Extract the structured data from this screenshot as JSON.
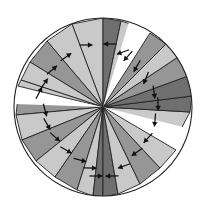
{
  "figure": {
    "kind": "geometric-diagram",
    "background_color": "#ffffff",
    "outline_color": "#232323",
    "arrow_color": "#111111",
    "canvas": {
      "width": 212,
      "height": 216
    }
  },
  "chart_data": {
    "type": "diagram",
    "xlabel": "",
    "ylabel": "",
    "grid": false,
    "legend": "none",
    "circle": {
      "cx": 103,
      "cy": 107,
      "r": 89,
      "stroke": "#232323"
    },
    "palette": {
      "light": "#c9c9c9",
      "medium": "#969696",
      "dark": "#6f6f6f",
      "gap": "#ffffff"
    },
    "gaps": [
      {
        "name": "gap-upper-right",
        "start_deg": 62,
        "end_deg": 73,
        "note": "white wedge from center toward upper right"
      },
      {
        "name": "gap-left",
        "start_deg": 168,
        "end_deg": 178,
        "note": "white wedge from center toward left"
      },
      {
        "name": "gap-lower-right",
        "start_deg": 336,
        "end_deg": 346,
        "note": "white wedge from center toward lower right"
      }
    ],
    "sectors": [
      {
        "id": 1,
        "start_deg": 73,
        "end_deg": 113,
        "triangles": 4,
        "label": "top sector"
      },
      {
        "id": 2,
        "start_deg": 113,
        "end_deg": 168,
        "triangles": 5,
        "label": "upper-left sector"
      },
      {
        "id": 3,
        "start_deg": 178,
        "end_deg": 248,
        "triangles": 6,
        "label": "lower-left sector"
      },
      {
        "id": 4,
        "start_deg": 248,
        "end_deg": 336,
        "triangles": 7,
        "label": "bottom sector"
      },
      {
        "id": 5,
        "start_deg": 346,
        "end_deg": 62,
        "triangles": 7,
        "label": "right sector"
      }
    ],
    "triangles": [
      {
        "a": [
          103,
          107
        ],
        "b": [
          103,
          18
        ],
        "c": [
          72,
          24
        ],
        "shade": "light",
        "arrow": {
          "x": 86,
          "y": 45,
          "angle_deg": 0
        }
      },
      {
        "a": [
          103,
          107
        ],
        "b": [
          103,
          18
        ],
        "c": [
          121,
          21
        ],
        "shade": "dark",
        "arrow": {
          "x": 110,
          "y": 44,
          "angle_deg": 180
        }
      },
      {
        "a": [
          103,
          107
        ],
        "b": [
          72,
          24
        ],
        "c": [
          47,
          41
        ],
        "shade": "light",
        "arrow": {
          "x": 66,
          "y": 57,
          "angle_deg": 35
        }
      },
      {
        "a": [
          103,
          107
        ],
        "b": [
          121,
          21
        ],
        "c": [
          140,
          27
        ],
        "shade": "light",
        "arrow": {
          "x": 123,
          "y": 52,
          "angle_deg": 200
        }
      },
      {
        "a": [
          103,
          107
        ],
        "b": [
          47,
          41
        ],
        "c": [
          30,
          62
        ],
        "shade": "medium",
        "arrow": {
          "x": 52,
          "y": 70,
          "angle_deg": 40
        }
      },
      {
        "a": [
          103,
          107
        ],
        "b": [
          30,
          62
        ],
        "c": [
          21,
          80
        ],
        "shade": "light",
        "arrow": {
          "x": 44,
          "y": 84,
          "angle_deg": 55
        }
      },
      {
        "a": [
          103,
          107
        ],
        "b": [
          21,
          80
        ],
        "c": [
          18,
          86
        ],
        "shade": "light",
        "arrow": {
          "x": 39,
          "y": 93,
          "angle_deg": 62
        }
      },
      {
        "a": [
          103,
          107
        ],
        "b": [
          18,
          97
        ],
        "c": [
          16,
          115
        ],
        "shade": "medium",
        "arrow": {
          "x": 45,
          "y": 110,
          "angle_deg": 285
        }
      },
      {
        "a": [
          103,
          107
        ],
        "b": [
          16,
          115
        ],
        "c": [
          22,
          140
        ],
        "shade": "light",
        "arrow": {
          "x": 47,
          "y": 124,
          "angle_deg": 300
        }
      },
      {
        "a": [
          103,
          107
        ],
        "b": [
          22,
          140
        ],
        "c": [
          36,
          161
        ],
        "shade": "medium",
        "arrow": {
          "x": 55,
          "y": 137,
          "angle_deg": 318
        }
      },
      {
        "a": [
          103,
          107
        ],
        "b": [
          36,
          161
        ],
        "c": [
          55,
          177
        ],
        "shade": "light",
        "arrow": {
          "x": 66,
          "y": 150,
          "angle_deg": 330
        }
      },
      {
        "a": [
          103,
          107
        ],
        "b": [
          55,
          177
        ],
        "c": [
          77,
          190
        ],
        "shade": "medium",
        "arrow": {
          "x": 80,
          "y": 160,
          "angle_deg": 345
        }
      },
      {
        "a": [
          103,
          107
        ],
        "b": [
          77,
          190
        ],
        "c": [
          93,
          196
        ],
        "shade": "light",
        "arrow": {
          "x": 90,
          "y": 168,
          "angle_deg": 358
        }
      },
      {
        "a": [
          103,
          107
        ],
        "b": [
          93,
          196
        ],
        "c": [
          103,
          197
        ],
        "shade": "dark",
        "arrow": {
          "x": 96,
          "y": 176,
          "angle_deg": 0
        }
      },
      {
        "a": [
          103,
          107
        ],
        "b": [
          103,
          197
        ],
        "c": [
          118,
          194
        ],
        "shade": "dark",
        "arrow": {
          "x": 112,
          "y": 176,
          "angle_deg": 182
        }
      },
      {
        "a": [
          103,
          107
        ],
        "b": [
          118,
          194
        ],
        "c": [
          140,
          184
        ],
        "shade": "light",
        "arrow": {
          "x": 124,
          "y": 166,
          "angle_deg": 200
        }
      },
      {
        "a": [
          103,
          107
        ],
        "b": [
          140,
          184
        ],
        "c": [
          160,
          168
        ],
        "shade": "medium",
        "arrow": {
          "x": 137,
          "y": 152,
          "angle_deg": 215
        }
      },
      {
        "a": [
          103,
          107
        ],
        "b": [
          160,
          168
        ],
        "c": [
          176,
          150
        ],
        "shade": "light",
        "arrow": {
          "x": 148,
          "y": 138,
          "angle_deg": 228
        }
      },
      {
        "a": [
          103,
          107
        ],
        "b": [
          180,
          131
        ],
        "c": [
          190,
          112
        ],
        "shade": "light",
        "arrow": {
          "x": 155,
          "y": 120,
          "angle_deg": 265
        }
      },
      {
        "a": [
          103,
          107
        ],
        "b": [
          190,
          112
        ],
        "c": [
          192,
          96
        ],
        "shade": "dark",
        "arrow": {
          "x": 158,
          "y": 104,
          "angle_deg": 272
        }
      },
      {
        "a": [
          103,
          107
        ],
        "b": [
          192,
          96
        ],
        "c": [
          188,
          76
        ],
        "shade": "dark",
        "arrow": {
          "x": 154,
          "y": 92,
          "angle_deg": 278
        }
      },
      {
        "a": [
          103,
          107
        ],
        "b": [
          188,
          76
        ],
        "c": [
          178,
          57
        ],
        "shade": "medium",
        "arrow": {
          "x": 146,
          "y": 78,
          "angle_deg": 248
        }
      },
      {
        "a": [
          103,
          107
        ],
        "b": [
          178,
          57
        ],
        "c": [
          166,
          44
        ],
        "shade": "light",
        "arrow": {
          "x": 137,
          "y": 66,
          "angle_deg": 240
        }
      },
      {
        "a": [
          103,
          107
        ],
        "b": [
          166,
          44
        ],
        "c": [
          150,
          33
        ],
        "shade": "medium",
        "arrow": {
          "x": 128,
          "y": 56,
          "angle_deg": 228
        }
      }
    ],
    "arrow_count": 24,
    "arrow_length_px": 13
  }
}
